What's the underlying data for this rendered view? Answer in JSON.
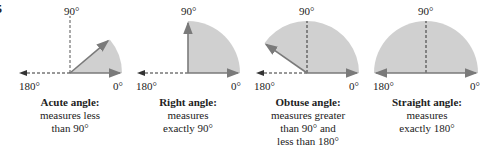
{
  "figure_number": "5",
  "colors": {
    "fill": "#d0d0d0",
    "ray": "#7a7a7a",
    "dashed": "#333333"
  },
  "panels": [
    {
      "title": "Acute angle:",
      "desc": [
        "measures less",
        "than 90°"
      ],
      "top": "90°",
      "left": "180°",
      "right": "0°",
      "angle_deg": 40
    },
    {
      "title": "Right angle:",
      "desc": [
        "measures",
        "exactly 90°"
      ],
      "top": "90°",
      "left": "180°",
      "right": "0°",
      "angle_deg": 90
    },
    {
      "title": "Obtuse angle:",
      "desc": [
        "measures greater",
        "than 90° and",
        "less than 180°"
      ],
      "top": "90°",
      "left": "180°",
      "right": "0°",
      "angle_deg": 145
    },
    {
      "title": "Straight angle:",
      "desc": [
        "measures",
        "exactly 180°"
      ],
      "top": "90°",
      "left": "180°",
      "right": "0°",
      "angle_deg": 180
    }
  ]
}
